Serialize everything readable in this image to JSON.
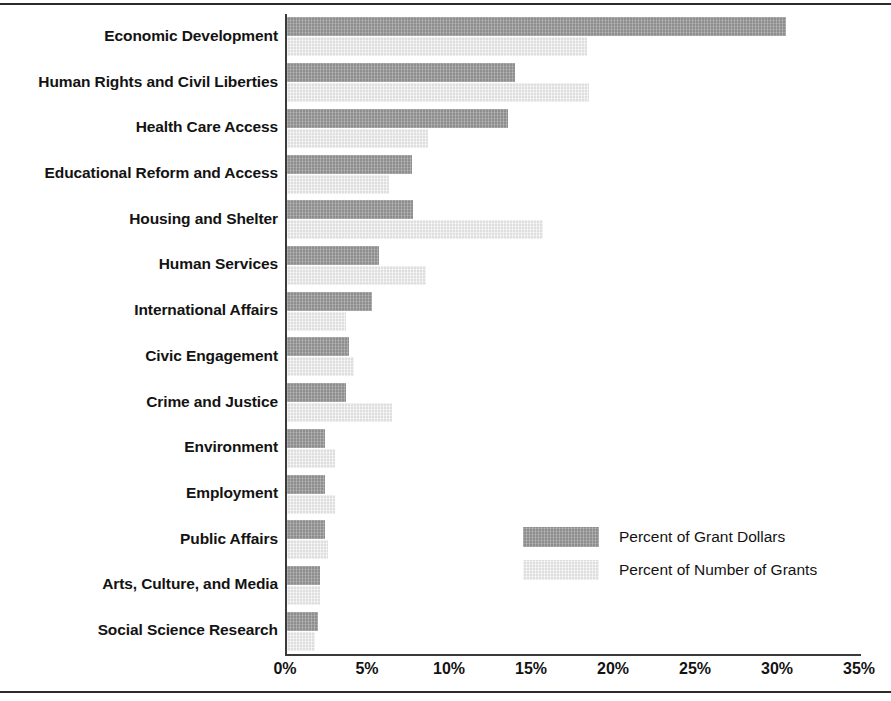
{
  "chart_data": {
    "type": "bar",
    "orientation": "horizontal",
    "title": "",
    "subtitle": "",
    "xlabel": "",
    "ylabel": "",
    "xlim": [
      0,
      35
    ],
    "xticks": [
      "0%",
      "5%",
      "10%",
      "15%",
      "20%",
      "25%",
      "30%",
      "35%"
    ],
    "xtick_values": [
      0,
      5,
      10,
      15,
      20,
      25,
      30,
      35
    ],
    "grid": false,
    "legend_position": "center-right",
    "categories": [
      "Economic Development",
      "Human Rights and Civil Liberties",
      "Health Care Access",
      "Educational Reform and Access",
      "Housing and Shelter",
      "Human Services",
      "International Affairs",
      "Civic Engagement",
      "Crime and Justice",
      "Environment",
      "Employment",
      "Public Affairs",
      "Arts, Culture, and Media",
      "Social Science Research"
    ],
    "series": [
      {
        "name": "Percent of Grant Dollars",
        "color": "#8e8e8e",
        "values": [
          30.4,
          13.9,
          13.5,
          7.6,
          7.7,
          5.6,
          5.2,
          3.8,
          3.6,
          2.3,
          2.3,
          2.3,
          2.0,
          1.9
        ]
      },
      {
        "name": "Percent of Number of Grants",
        "color": "#dedede",
        "values": [
          18.3,
          18.4,
          8.6,
          6.2,
          15.6,
          8.5,
          3.6,
          4.1,
          6.4,
          2.9,
          2.9,
          2.5,
          2.0,
          1.7
        ]
      }
    ]
  },
  "legend": {
    "items": [
      {
        "label": "Percent of Grant Dollars",
        "swatch": "dollars"
      },
      {
        "label": "Percent of Number of Grants",
        "swatch": "grants"
      }
    ]
  },
  "colors": {
    "series_dollars": "#8e8e8e",
    "series_grants": "#dedede",
    "axis": "#3a3a3a",
    "rule": "#2b2b2b",
    "text": "#131313",
    "background": "#ffffff"
  }
}
